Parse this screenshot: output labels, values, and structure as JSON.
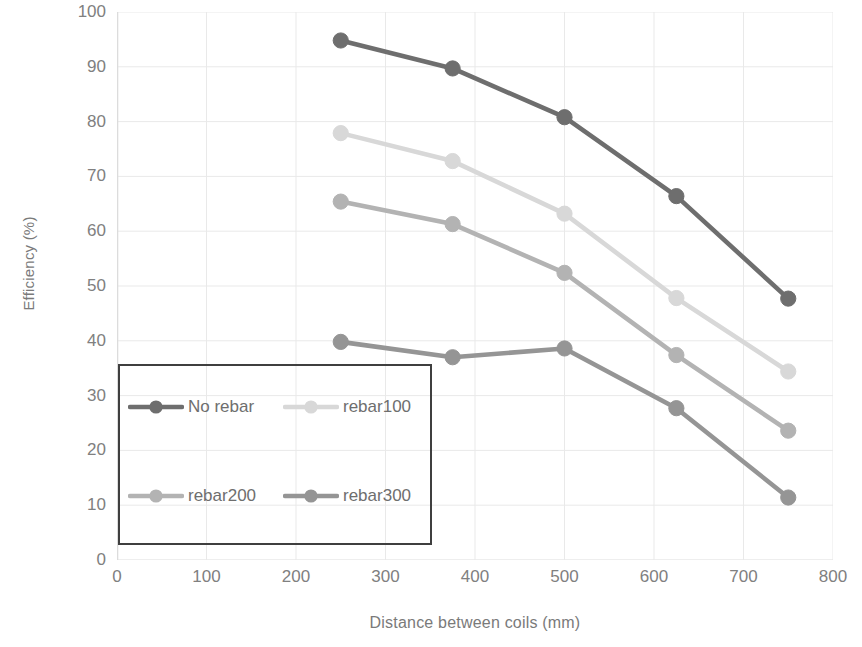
{
  "chart_data": {
    "type": "line",
    "title": "",
    "xlabel": "Distance between coils (mm)",
    "ylabel": "Efficiency (%)",
    "x": [
      250,
      375,
      500,
      625,
      750
    ],
    "xlim": [
      0,
      800
    ],
    "ylim": [
      0,
      100
    ],
    "xticks": [
      0,
      100,
      200,
      300,
      400,
      500,
      600,
      700,
      800
    ],
    "yticks": [
      0,
      10,
      20,
      30,
      40,
      50,
      60,
      70,
      80,
      90,
      100
    ],
    "grid": true,
    "legend_position": "inside-lower-left",
    "series": [
      {
        "name": "No rebar",
        "values": [
          94.8,
          89.7,
          80.8,
          66.4,
          47.7
        ],
        "color": "#6e6e6e"
      },
      {
        "name": "rebar100",
        "values": [
          77.9,
          72.8,
          63.2,
          47.8,
          34.4
        ],
        "color": "#d8d8d8"
      },
      {
        "name": "rebar200",
        "values": [
          65.4,
          61.3,
          52.4,
          37.4,
          23.6
        ],
        "color": "#b3b3b3"
      },
      {
        "name": "rebar300",
        "values": [
          39.8,
          37.0,
          38.6,
          27.7,
          11.4
        ],
        "color": "#959595"
      }
    ]
  },
  "axis": {
    "y_tick_labels": [
      "100",
      "90",
      "80",
      "70",
      "60",
      "50",
      "40",
      "30",
      "20",
      "10",
      "0"
    ],
    "x_tick_labels": [
      "0",
      "100",
      "200",
      "300",
      "400",
      "500",
      "600",
      "700",
      "800"
    ],
    "y_title": "Efficiency (%)",
    "x_title": "Distance between coils (mm)"
  },
  "legend": {
    "entries": [
      {
        "label": "No rebar"
      },
      {
        "label": "rebar100"
      },
      {
        "label": "rebar200"
      },
      {
        "label": "rebar300"
      }
    ]
  },
  "colors": {
    "grid": "#e9e9e9",
    "axis_text": "#808080",
    "legend_border": "#3f3f3f",
    "background": "#ffffff"
  }
}
